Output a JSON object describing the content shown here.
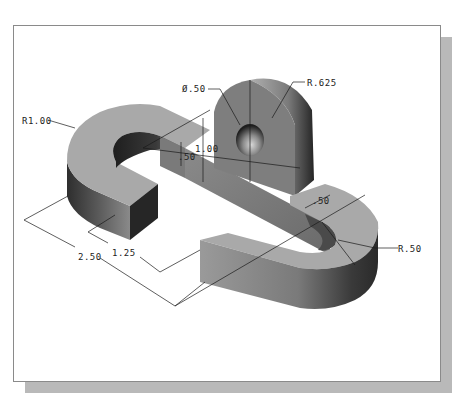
{
  "figure": {
    "frame_color": "#8a8a8a",
    "shadow_color": "#b9b9b9",
    "background": "#ffffff"
  },
  "dimensions": {
    "hole_diameter": "Ø.50",
    "boss_radius": "R.625",
    "outer_radius_left": "R1.00",
    "slot_width_left": ".50",
    "boss_height": "1.00",
    "slot_width_right": ".50",
    "inner_radius_right": "R.50",
    "leg_length": "1.25",
    "overall_length": "2.50"
  },
  "colors": {
    "top_face": "#a9a9a9",
    "side_dark": "#3c3c3c",
    "side_mid": "#6e6e6e",
    "side_light": "#9a9a9a",
    "end_face": "#2a2a2a",
    "dim_line": "#1a1a1a"
  }
}
